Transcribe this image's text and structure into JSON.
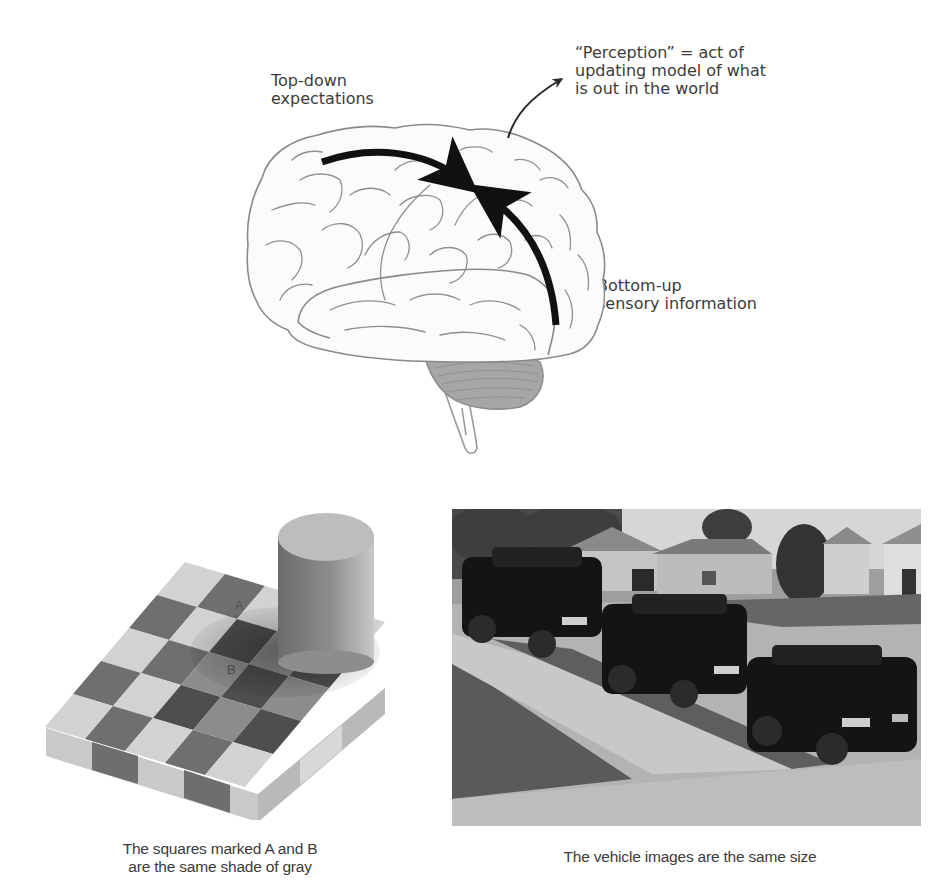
{
  "brain_diagram": {
    "top_down_label": [
      "Top-down",
      "expectations"
    ],
    "perception_label": [
      "“Perception” = act of",
      "updating model of what",
      "is out in the world"
    ],
    "bottom_up_label": [
      "Bottom-up",
      "sensory information"
    ],
    "arrow_color": "#111111",
    "outline_color": "#8a8a8a",
    "cerebellum_color": "#9a9a9a"
  },
  "illusions": {
    "checkerboard": {
      "square_a_label": "A",
      "square_b_label": "B",
      "caption": [
        "The squares marked A and B",
        "are the same shade of gray"
      ]
    },
    "vehicles": {
      "caption": "The vehicle images are the same size"
    }
  }
}
